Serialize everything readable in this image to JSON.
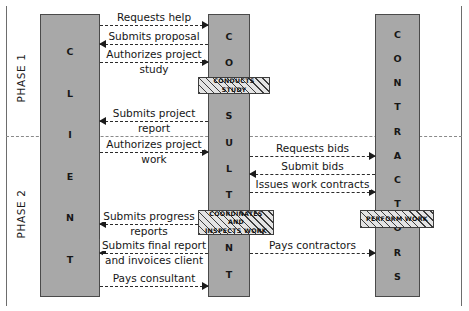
{
  "diagram": {
    "phases": [
      {
        "id": "phase-1",
        "label": "PHASE 1"
      },
      {
        "id": "phase-2",
        "label": "PHASE 2"
      }
    ],
    "actors": [
      {
        "id": "client",
        "name": "CLIENT",
        "letters": [
          "C",
          "L",
          "I",
          "E",
          "N",
          "T"
        ]
      },
      {
        "id": "consultant",
        "name": "CONSULTANT",
        "letters": [
          "C",
          "O",
          "N",
          "S",
          "U",
          "L",
          "T",
          "A",
          "N",
          "T"
        ]
      },
      {
        "id": "contractor",
        "name": "CONTRACTORS",
        "letters": [
          "C",
          "O",
          "N",
          "T",
          "R",
          "A",
          "C",
          "T",
          "O",
          "R",
          "S"
        ]
      }
    ],
    "activities": [
      {
        "id": "conducts-study",
        "label": "CONDUCTS STUDY",
        "actor": "consultant"
      },
      {
        "id": "coordinates-work",
        "label_line1": "COORDINATES AND",
        "label_line2": "INSPECTS WORK",
        "actor": "consultant"
      },
      {
        "id": "perform-work",
        "label": "PERFORM WORK",
        "actor": "contractor"
      }
    ],
    "flows": [
      {
        "id": "requests-help",
        "label_line1": "Requests help",
        "label_line2": "",
        "from": "client",
        "to": "consultant",
        "direction": "right",
        "phase": "phase-1"
      },
      {
        "id": "submits-proposal",
        "label_line1": "Submits proposal",
        "label_line2": "",
        "from": "consultant",
        "to": "client",
        "direction": "left",
        "phase": "phase-1"
      },
      {
        "id": "authorizes-study",
        "label_line1": "Authorizes project",
        "label_line2": "study",
        "from": "client",
        "to": "consultant",
        "direction": "right",
        "phase": "phase-1"
      },
      {
        "id": "submits-report",
        "label_line1": "Submits project",
        "label_line2": "report",
        "from": "consultant",
        "to": "client",
        "direction": "left",
        "phase": "phase-1"
      },
      {
        "id": "authorizes-work",
        "label_line1": "Authorizes project",
        "label_line2": "work",
        "from": "client",
        "to": "consultant",
        "direction": "right",
        "phase": "phase-2"
      },
      {
        "id": "requests-bids",
        "label_line1": "Requests bids",
        "label_line2": "",
        "from": "consultant",
        "to": "contractor",
        "direction": "right",
        "phase": "phase-2"
      },
      {
        "id": "submit-bids",
        "label_line1": "Submit bids",
        "label_line2": "",
        "from": "contractor",
        "to": "consultant",
        "direction": "left",
        "phase": "phase-2"
      },
      {
        "id": "issues-work-contracts",
        "label_line1": "Issues work contracts",
        "label_line2": "",
        "from": "consultant",
        "to": "contractor",
        "direction": "right",
        "phase": "phase-2"
      },
      {
        "id": "submits-progress",
        "label_line1": "Submits progress",
        "label_line2": "reports",
        "from": "consultant",
        "to": "client",
        "direction": "left",
        "phase": "phase-2"
      },
      {
        "id": "pays-contractors",
        "label_line1": "Pays contractors",
        "label_line2": "",
        "from": "consultant",
        "to": "contractor",
        "direction": "right",
        "phase": "phase-2"
      },
      {
        "id": "submits-final-report",
        "label_line1": "Submits final report",
        "label_line2": "and invoices client",
        "from": "consultant",
        "to": "client",
        "direction": "left",
        "phase": "phase-2"
      },
      {
        "id": "pays-consultant",
        "label_line1": "Pays consultant",
        "label_line2": "",
        "from": "client",
        "to": "consultant",
        "direction": "right",
        "phase": "phase-2"
      }
    ],
    "colors": {
      "actor_fill": "#a8a8a8",
      "actor_border": "#4a4a4a",
      "activity_hatch": "#3d3d3d",
      "flow_line": "#2b2b2b",
      "frame_rule": "#6d6d6d"
    }
  }
}
